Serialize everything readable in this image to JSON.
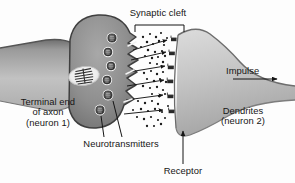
{
  "figure": {
    "background_color": "#fdfdfd",
    "ink_color": "#161616"
  },
  "labels": {
    "synaptic_cleft": "Synaptic cleft",
    "impulse": "Impulse",
    "terminal_end": "Terminal end\nof axon\n(neuron 1)",
    "dendrites": "Dendrites\n(neuron 2)",
    "neurotransmitters": "Neurotransmitters",
    "receptor": "Receptor"
  },
  "structures": {
    "presynaptic_neuron": {
      "name": "Terminal end of axon (neuron 1)",
      "fill_dark": "#8d8d8d",
      "fill_light": "#c9c9c9",
      "outline": "#3a3a3a"
    },
    "postsynaptic_neuron": {
      "name": "Dendrites (neuron 2)",
      "fill_dark": "#a8a8a8",
      "fill_light": "#d8d8d8",
      "outline": "#5a5a5a"
    },
    "mitochondrion": {
      "name": "mitochondrion",
      "fill": "#f4f4f4",
      "cristae_count": 7
    },
    "vesicles": {
      "name": "synaptic vesicles",
      "count": 6,
      "fill": "#4a4a4a",
      "halo": "#f0f0f0"
    },
    "receptors": {
      "name": "receptor sites",
      "count": 6,
      "fill": "#2b2b2b"
    },
    "neurotransmitter_particles": {
      "name": "neurotransmitter molecules",
      "count": 54,
      "fill": "#1c1c1c"
    },
    "release_arrows": {
      "name": "diffusion arrows",
      "count": 6
    }
  },
  "annotations": {
    "cleft_bracket": {
      "x_start": 135,
      "x_end": 184,
      "y": 26
    },
    "impulse_arrow_direction": "right",
    "receptor_leader_direction": "up",
    "neurotransmitter_leader_count": 2
  }
}
